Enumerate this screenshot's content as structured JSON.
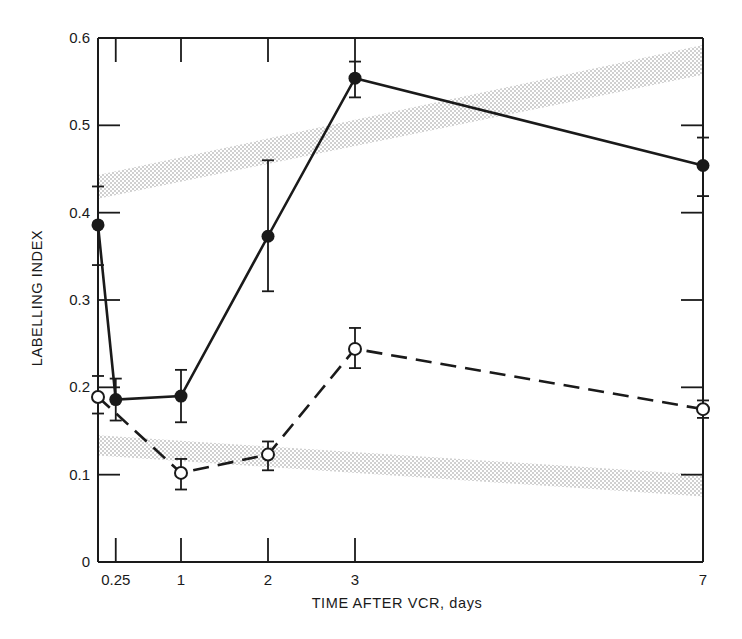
{
  "chart_data": {
    "type": "line",
    "title": "",
    "xlabel": "TIME AFTER VCR, days",
    "ylabel": "LABELLING INDEX",
    "xlim": [
      0,
      7
    ],
    "ylim": [
      0,
      0.6
    ],
    "grid": false,
    "legend": null,
    "x_ticks": [
      {
        "value": 0.25,
        "label": "0.25"
      },
      {
        "value": 1,
        "label": "1"
      },
      {
        "value": 2,
        "label": "2"
      },
      {
        "value": 3,
        "label": "3"
      },
      {
        "value": 7,
        "label": "7"
      }
    ],
    "y_ticks": [
      {
        "value": 0,
        "label": "0"
      },
      {
        "value": 0.1,
        "label": "0.1"
      },
      {
        "value": 0.2,
        "label": "0.2"
      },
      {
        "value": 0.3,
        "label": "0.3"
      },
      {
        "value": 0.4,
        "label": "0.4"
      },
      {
        "value": 0.5,
        "label": "0.5"
      },
      {
        "value": 0.6,
        "label": "0.6"
      }
    ],
    "series": [
      {
        "name": "filled circles (solid line)",
        "marker": "filled-circle",
        "line_style": "solid",
        "x": [
          0.05,
          0.25,
          1,
          2,
          3,
          7
        ],
        "y": [
          0.386,
          0.186,
          0.19,
          0.373,
          0.554,
          0.454
        ],
        "err_low": [
          0.34,
          0.162,
          0.16,
          0.31,
          0.532,
          0.419
        ],
        "err_high": [
          0.43,
          0.21,
          0.22,
          0.46,
          0.573,
          0.486
        ]
      },
      {
        "name": "open circles (dashed line)",
        "marker": "open-circle",
        "line_style": "dashed",
        "x": [
          0.05,
          1,
          2,
          3,
          7
        ],
        "y": [
          0.189,
          0.102,
          0.123,
          0.244,
          0.175
        ],
        "err_low": [
          0.17,
          0.083,
          0.105,
          0.222,
          0.165
        ],
        "err_high": [
          0.213,
          0.118,
          0.138,
          0.268,
          0.185
        ]
      }
    ],
    "bands": [
      {
        "name": "upper stippled reference band",
        "fill": "stipple",
        "x": [
          0.05,
          7
        ],
        "low": [
          0.416,
          0.558
        ],
        "high": [
          0.443,
          0.592
        ]
      },
      {
        "name": "lower stippled reference band",
        "fill": "stipple",
        "x": [
          0.05,
          7
        ],
        "low": [
          0.122,
          0.075
        ],
        "high": [
          0.145,
          0.1
        ]
      }
    ]
  },
  "colors": {
    "ink": "#1a1a1a",
    "stipple": "#8a8a8a",
    "background": "#ffffff"
  }
}
